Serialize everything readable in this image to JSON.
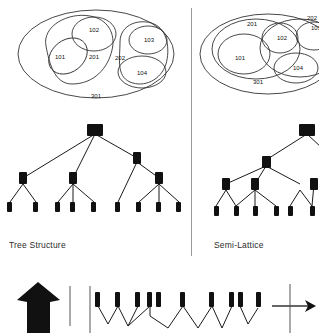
{
  "figure": {
    "title_left": "Tree Structure",
    "title_right": "Semi-Lattice",
    "step_number": "3",
    "set_labels": {
      "l101": "101",
      "l102": "102",
      "l103": "103",
      "l104": "104",
      "l201": "201",
      "l202": "202",
      "l301": "301"
    },
    "set_labels_right": {
      "r101": "101",
      "r102": "102",
      "r103": "103",
      "r104": "104",
      "r201": "201",
      "r202": "202",
      "r301": "301"
    },
    "colors": {
      "ink": "#1a1a1a",
      "node": "#111111",
      "divider": "#9a9a9a",
      "background": "#ffffff"
    },
    "icons": {
      "up_arrow": "arrow-up",
      "right_arrow": "arrow-right"
    }
  }
}
